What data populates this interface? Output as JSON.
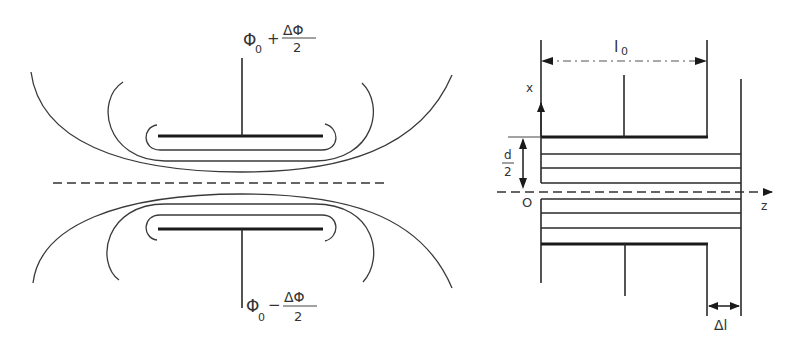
{
  "left_diagram": {
    "top_electrode_label": {
      "base": "Φ",
      "subscript": "0",
      "operator": "+",
      "numerator": "ΔΦ",
      "denominator": "2"
    },
    "bottom_electrode_label": {
      "base": "Φ",
      "subscript": "0",
      "operator": "−",
      "numerator": "ΔΦ",
      "denominator": "2"
    }
  },
  "right_diagram": {
    "x_axis_label": "x",
    "z_axis_label": "z",
    "origin_label": "O",
    "length_label": "l",
    "length_subscript": "0",
    "half_gap_numerator": "d",
    "half_gap_denominator": "2",
    "delta_length_label": "Δl"
  },
  "colors": {
    "line": "#2a2a2a",
    "background": "#ffffff"
  }
}
